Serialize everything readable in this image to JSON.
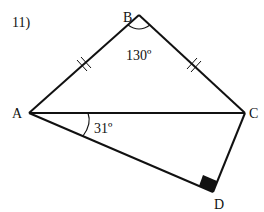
{
  "problem": {
    "number": "11)"
  },
  "vertices": {
    "A": {
      "label": "A",
      "x": 29,
      "y": 113
    },
    "B": {
      "label": "B",
      "x": 139,
      "y": 15
    },
    "C": {
      "label": "C",
      "x": 245,
      "y": 113
    },
    "D": {
      "label": "D",
      "x": 213,
      "y": 192
    }
  },
  "segments": [
    {
      "from": "A",
      "to": "B",
      "ticks": 2
    },
    {
      "from": "B",
      "to": "C",
      "ticks": 2
    },
    {
      "from": "A",
      "to": "C",
      "ticks": 0
    },
    {
      "from": "A",
      "to": "D",
      "ticks": 0
    },
    {
      "from": "C",
      "to": "D",
      "ticks": 0
    }
  ],
  "angles": {
    "B": {
      "label": "130º",
      "value": 130
    },
    "CAD": {
      "label": "31º",
      "value": 31
    },
    "D": {
      "label": "right angle",
      "value": 90
    }
  },
  "colors": {
    "stroke": "#111111",
    "background": "#ffffff"
  }
}
